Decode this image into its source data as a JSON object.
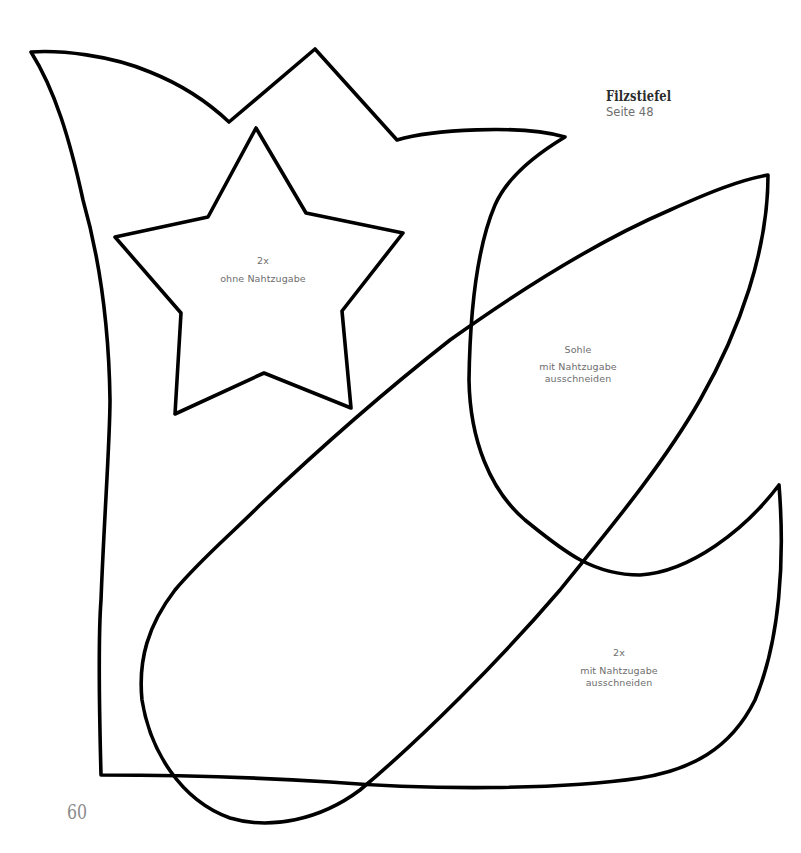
{
  "header": {
    "title": "Filzstiefel",
    "subtitle": "Seite 48"
  },
  "pieces": {
    "star": {
      "quantity": "2x",
      "instruction": "ohne Nahtzugabe"
    },
    "sole": {
      "name": "Sohle",
      "instruction_line1": "mit Nahtzugabe",
      "instruction_line2": "ausschneiden"
    },
    "boot": {
      "quantity": "2x",
      "instruction_line1": "mit Nahtzugabe",
      "instruction_line2": "ausschneiden"
    }
  },
  "footer": {
    "page_number": "60"
  },
  "colors": {
    "outline": "#000000",
    "label_text": "#6e6e6e",
    "title_text": "#2b2b2b",
    "page_number": "#8a8a8a"
  }
}
